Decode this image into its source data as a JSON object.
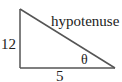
{
  "diagram": {
    "type": "right-triangle",
    "labels": {
      "vertical_side": "12",
      "horizontal_side": "5",
      "hypotenuse": "hypotenuse",
      "angle": "θ"
    },
    "colors": {
      "stroke": "#555555",
      "text": "#222222",
      "background": "#ffffff"
    }
  }
}
